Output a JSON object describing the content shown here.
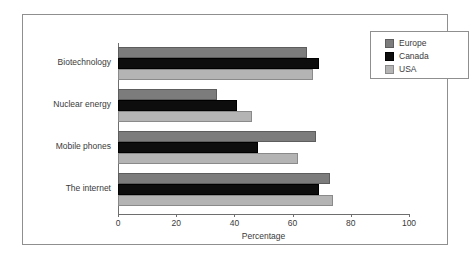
{
  "chart_data": {
    "type": "bar",
    "orientation": "horizontal",
    "title": "",
    "xlabel": "Percentage",
    "ylabel": "",
    "xlim": [
      0,
      100
    ],
    "xticks": [
      0,
      20,
      40,
      60,
      80,
      100
    ],
    "grid": false,
    "legend_position": "top-right",
    "categories": [
      "Biotechnology",
      "Nuclear energy",
      "Mobile phones",
      "The internet"
    ],
    "series": [
      {
        "name": "Europe",
        "color": "#7c7c7c",
        "values": [
          65,
          34,
          68,
          73
        ]
      },
      {
        "name": "Canada",
        "color": "#0d0d0d",
        "values": [
          69,
          41,
          48,
          69
        ]
      },
      {
        "name": "USA",
        "color": "#b4b4b4",
        "values": [
          67,
          46,
          62,
          74
        ]
      }
    ]
  },
  "legend": {
    "items": [
      {
        "label": "Europe"
      },
      {
        "label": "Canada"
      },
      {
        "label": "USA"
      }
    ]
  },
  "axis": {
    "x_title": "Percentage",
    "tick_labels": [
      "0",
      "20",
      "40",
      "60",
      "80",
      "100"
    ]
  }
}
